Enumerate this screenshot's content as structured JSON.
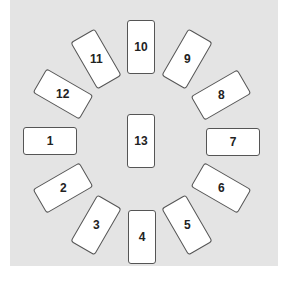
{
  "diagram": {
    "type": "tarot-card-spread",
    "background_color": "#e4e4e4",
    "card_fill": "#ffffff",
    "card_border": "#555555",
    "cards": [
      {
        "label": "1",
        "cx": 50,
        "cy": 141,
        "orientation": "landscape",
        "rotation": 0
      },
      {
        "label": "2",
        "cx": 63,
        "cy": 188,
        "orientation": "landscape",
        "rotation": -30
      },
      {
        "label": "3",
        "cx": 96,
        "cy": 225,
        "orientation": "portrait",
        "rotation": 30
      },
      {
        "label": "4",
        "cx": 142,
        "cy": 237,
        "orientation": "portrait",
        "rotation": 0
      },
      {
        "label": "5",
        "cx": 187,
        "cy": 225,
        "orientation": "portrait",
        "rotation": -30
      },
      {
        "label": "6",
        "cx": 221,
        "cy": 188,
        "orientation": "landscape",
        "rotation": 30
      },
      {
        "label": "7",
        "cx": 233,
        "cy": 142,
        "orientation": "landscape",
        "rotation": 0
      },
      {
        "label": "8",
        "cx": 221,
        "cy": 95,
        "orientation": "landscape",
        "rotation": -30
      },
      {
        "label": "9",
        "cx": 187,
        "cy": 59,
        "orientation": "portrait",
        "rotation": 30
      },
      {
        "label": "10",
        "cx": 141,
        "cy": 47,
        "orientation": "portrait",
        "rotation": 0
      },
      {
        "label": "11",
        "cx": 96,
        "cy": 59,
        "orientation": "portrait",
        "rotation": -30
      },
      {
        "label": "12",
        "cx": 63,
        "cy": 94,
        "orientation": "landscape",
        "rotation": 30
      },
      {
        "label": "13",
        "cx": 141,
        "cy": 141,
        "orientation": "portrait",
        "rotation": 0
      }
    ]
  }
}
